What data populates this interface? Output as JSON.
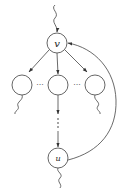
{
  "diagram": {
    "nodes": [
      {
        "id": "v",
        "label": "v",
        "cx": 57,
        "cy": 43,
        "r": 10
      },
      {
        "id": "left",
        "label": "",
        "cx": 22,
        "cy": 85,
        "r": 10
      },
      {
        "id": "mid",
        "label": "",
        "cx": 58,
        "cy": 85,
        "r": 10
      },
      {
        "id": "right",
        "label": "",
        "cx": 95,
        "cy": 85,
        "r": 10
      },
      {
        "id": "u",
        "label": "u",
        "cx": 58,
        "cy": 158,
        "r": 10
      }
    ],
    "edges": [
      {
        "from": "incoming",
        "to": "v",
        "style": "wavy-arrow"
      },
      {
        "from": "v",
        "to": "left",
        "style": "arrow"
      },
      {
        "from": "v",
        "to": "mid",
        "style": "arrow"
      },
      {
        "from": "v",
        "to": "right",
        "style": "arrow"
      },
      {
        "from": "mid",
        "to": "u",
        "style": "arrow-dotted-arrow"
      },
      {
        "from": "u",
        "to": "v",
        "style": "curved-arrow"
      },
      {
        "from": "left",
        "to": "out",
        "style": "wavy"
      },
      {
        "from": "right",
        "to": "out",
        "style": "wavy"
      },
      {
        "from": "u",
        "to": "out",
        "style": "wavy"
      }
    ],
    "ellipsis_horizontal": "···",
    "ellipsis_vertical": "⋮",
    "colors": {
      "stroke": "#444444",
      "background": "#ffffff"
    }
  }
}
